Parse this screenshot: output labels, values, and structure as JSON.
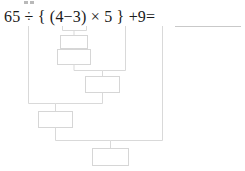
{
  "page": {
    "width": 245,
    "height": 171,
    "background_color": "#ffffff",
    "kind": "math-worksheet-order-of-operations"
  },
  "expression": {
    "text": "65 ÷ { (4−3) × 5 } +9=",
    "color": "#1a1a1a",
    "operands": [
      "65",
      "4",
      "3",
      "5",
      "9"
    ],
    "operators": [
      "÷",
      "−",
      "×",
      "+"
    ],
    "brackets": [
      "{",
      "(",
      ")",
      "}"
    ],
    "equals_sign": "="
  },
  "answer": {
    "value": "",
    "placeholder": "",
    "line_color": "#c9c9c9",
    "filled": false
  },
  "diagram": {
    "type": "order-of-operations-tree",
    "line_color": "#d9d9d9",
    "box_border_color": "#d6d6d6",
    "box_fill_color": "#ffffff",
    "boxes": [
      {
        "id": "box-1",
        "label": "",
        "step": 1,
        "x": 60,
        "y": 35,
        "w": 28,
        "h": 13
      },
      {
        "id": "box-2",
        "label": "",
        "step": 2,
        "x": 57,
        "y": 49,
        "w": 34,
        "h": 16
      },
      {
        "id": "box-3",
        "label": "",
        "step": 3,
        "x": 85,
        "y": 76,
        "w": 35,
        "h": 17
      },
      {
        "id": "box-4",
        "label": "",
        "step": 4,
        "x": 38,
        "y": 111,
        "w": 35,
        "h": 17
      },
      {
        "id": "box-5",
        "label": "",
        "step": 5,
        "x": 92,
        "y": 148,
        "w": 37,
        "h": 18
      }
    ],
    "drop_lines": [
      {
        "from": "65",
        "x": 28,
        "y_top": 26,
        "y_bottom": 103
      },
      {
        "from": "4",
        "x": 62,
        "y_top": 26,
        "y_bottom": 35
      },
      {
        "from": "3",
        "x": 86,
        "y_top": 26,
        "y_bottom": 35
      },
      {
        "from": "5",
        "x": 125,
        "y_top": 26,
        "y_bottom": 70
      },
      {
        "from": "9",
        "x": 162,
        "y_top": 26,
        "y_bottom": 140
      }
    ]
  },
  "specks": [
    {
      "x": 24,
      "y": 1,
      "w": 4,
      "h": 3
    },
    {
      "x": 30,
      "y": 1,
      "w": 4,
      "h": 3
    }
  ]
}
